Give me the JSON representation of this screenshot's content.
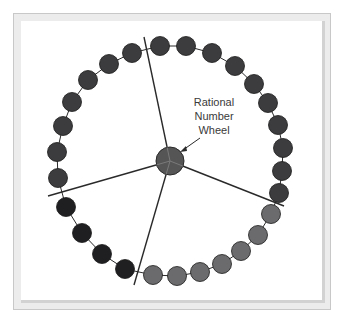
{
  "diagram": {
    "label_lines": [
      "Rational",
      "Number",
      "Wheel"
    ],
    "hub": {
      "cx": 170,
      "cy": 161,
      "r": 14,
      "color": "#555555"
    },
    "colors": {
      "dark": "#3c3c3e",
      "medium": "#6b6b6d",
      "black": "#1f1f22",
      "line": "#2a2a2a"
    },
    "dividers": [
      {
        "x2": 144,
        "y2": 37
      },
      {
        "x2": 284,
        "y2": 206
      },
      {
        "x2": 134,
        "y2": 285
      },
      {
        "x2": 48,
        "y2": 196
      }
    ],
    "sections": [
      {
        "name": "top-right",
        "color": "dark",
        "beads": [
          [
            160,
            46
          ],
          [
            186,
            46
          ],
          [
            212,
            53
          ],
          [
            235,
            66
          ],
          [
            254,
            84
          ],
          [
            268,
            103
          ],
          [
            278,
            125
          ],
          [
            283,
            148
          ],
          [
            282,
            171
          ],
          [
            279,
            193
          ]
        ]
      },
      {
        "name": "bottom-right",
        "color": "medium",
        "beads": [
          [
            271,
            214
          ],
          [
            258,
            235
          ],
          [
            241,
            251
          ],
          [
            222,
            264
          ],
          [
            200,
            272
          ],
          [
            177,
            276
          ],
          [
            153,
            275
          ]
        ]
      },
      {
        "name": "bottom-left",
        "color": "black",
        "beads": [
          [
            125,
            269
          ],
          [
            102,
            254
          ],
          [
            82,
            233
          ],
          [
            66,
            207
          ]
        ]
      },
      {
        "name": "left",
        "color": "dark",
        "beads": [
          [
            58,
            178
          ],
          [
            57,
            152
          ],
          [
            63,
            126
          ],
          [
            72,
            102
          ],
          [
            88,
            80
          ],
          [
            109,
            64
          ],
          [
            132,
            53
          ]
        ]
      }
    ]
  }
}
